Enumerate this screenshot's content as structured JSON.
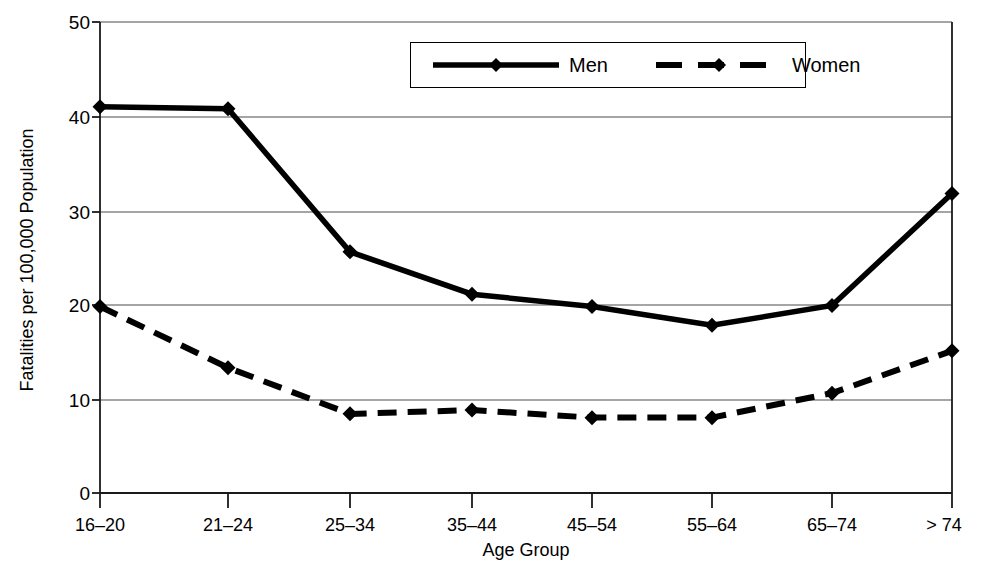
{
  "chart_data": {
    "type": "line",
    "title": "",
    "xlabel": "Age Group",
    "ylabel": "Fatalities per 100,000 Population",
    "categories": [
      "16–20",
      "21–24",
      "25–34",
      "35–44",
      "45–54",
      "55–64",
      "65–74",
      "> 74"
    ],
    "series": [
      {
        "name": "Men",
        "style": "solid",
        "marker": "diamond",
        "color": "#000000",
        "values": [
          41.0,
          40.8,
          25.6,
          21.1,
          19.8,
          17.8,
          19.9,
          31.8
        ]
      },
      {
        "name": "Women",
        "style": "dashed",
        "marker": "diamond",
        "color": "#000000",
        "values": [
          19.8,
          13.3,
          8.4,
          8.8,
          8.0,
          8.0,
          10.6,
          15.1
        ]
      }
    ],
    "ylim": [
      0,
      50
    ],
    "yticks": [
      0,
      10,
      20,
      30,
      40,
      50
    ],
    "ytick_labels": [
      "0",
      "10",
      "20",
      "30",
      "40",
      "50"
    ],
    "grid": "horizontal",
    "legend_position": "top-center",
    "legend": [
      {
        "label": "Men",
        "style": "solid"
      },
      {
        "label": "Women",
        "style": "dashed"
      }
    ]
  }
}
